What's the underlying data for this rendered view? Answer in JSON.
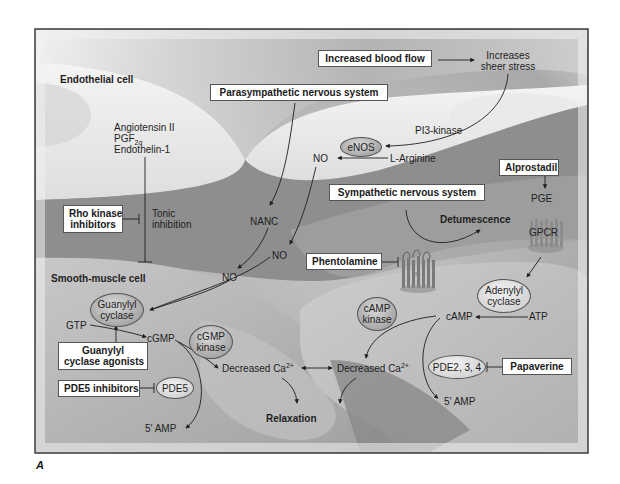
{
  "figure": {
    "letter": "A",
    "frame": {
      "x": 35,
      "y": 29,
      "width": 553,
      "height": 424
    }
  },
  "regions": {
    "endothelial_cell": "Endothelial cell",
    "smooth_muscle_cell": "Smooth-muscle cell"
  },
  "boxes": {
    "increased_blood_flow": "Increased blood flow",
    "parasympathetic": "Parasympathetic nervous system",
    "alprostadil": "Alprostadil",
    "sympathetic": "Sympathetic nervous system",
    "rho_kinase_line1": "Rho kinase",
    "rho_kinase_line2": "inhibitors",
    "phentolamine": "Phentolamine",
    "gc_agonists_line1": "Guanylyl",
    "gc_agonists_line2": "cyclase agonists",
    "pde5_inhibitors": "PDE5 inhibitors",
    "papaverine": "Papaverine"
  },
  "ellipses": {
    "enos": "eNOS",
    "guanylyl_cyclase_line1": "Guanylyl",
    "guanylyl_cyclase_line2": "cyclase",
    "cgmp_kinase_line1": "cGMP",
    "cgmp_kinase_line2": "kinase",
    "pde5": "PDE5",
    "adenylyl_cyclase_line1": "Adenylyl",
    "adenylyl_cyclase_line2": "cyclase",
    "camp_kinase_line1": "cAMP",
    "camp_kinase_line2": "kinase",
    "pde234": "PDE2, 3, 4"
  },
  "labels": {
    "increases_line1": "Increases",
    "increases_line2": "sheer stress",
    "pi3_kinase": "PI3-kinase",
    "l_arginine": "L-Arginine",
    "no_endothelial": "NO",
    "angiotensin": "Angiotensin II",
    "pgf": "PGF",
    "pgf_sub": "2α",
    "endothelin": "Endothelin-1",
    "tonic_line1": "Tonic",
    "tonic_line2": "inhibition",
    "nanc": "NANC",
    "no_right": "NO",
    "no_left": "NO",
    "pge": "PGE",
    "gpcr": "GPCR",
    "detumescence": "Detumescence",
    "receptor_a1": "α1",
    "gtp": "GTP",
    "cgmp": "cGMP",
    "camp": "cAMP",
    "atp": "ATP",
    "decreased_ca_left": "Decreased Ca",
    "decreased_ca_right": "Decreased Ca",
    "ca_charge": "2+",
    "five_amp_left": "5′ AMP",
    "five_amp_right": "5′ AMP",
    "relaxation": "Relaxation"
  },
  "colors": {
    "frame_border": "#3a3a3a",
    "box_border": "#555555",
    "arrow": "#1e1e1e",
    "endothelial_fill": "#e6e6e6",
    "smooth_muscle_fill": "#b4b4b4",
    "dark_tissue": "#8a8a8a"
  }
}
